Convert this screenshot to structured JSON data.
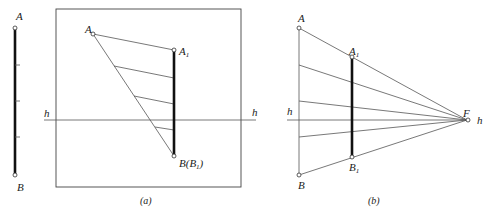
{
  "figure_left": {
    "label_A": "A",
    "label_B": "B",
    "ticks": 3
  },
  "figure_a": {
    "caption": "(a)",
    "label_A": "A",
    "label_A1": "A",
    "label_A1_sub": "1",
    "label_B": "B(B",
    "label_B_sub": "1",
    "label_B_close": ")",
    "label_h_left": "h",
    "label_h_right": "h"
  },
  "figure_b": {
    "caption": "(b)",
    "label_A": "A",
    "label_A1": "A",
    "label_A1_sub": "1",
    "label_B": "B",
    "label_B1": "B",
    "label_B1_sub": "1",
    "label_F": "F",
    "label_h_left": "h",
    "label_h_right": "h"
  },
  "colors": {
    "line": "#555555",
    "thick_line": "#111111",
    "background": "#ffffff"
  }
}
